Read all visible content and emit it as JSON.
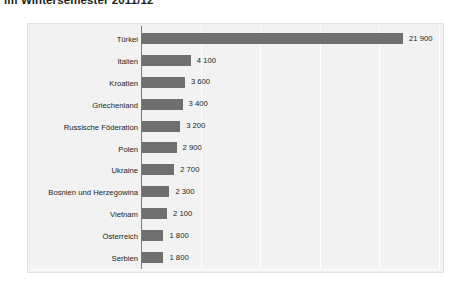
{
  "title": "im Wintersemester 2011/12",
  "chart_data": {
    "type": "bar",
    "orientation": "horizontal",
    "title": "im Wintersemester 2011/12",
    "xlabel": "",
    "ylabel": "",
    "xlim": [
      0,
      25000
    ],
    "grid": true,
    "gridlines_x": [
      5000,
      10000,
      15000,
      20000,
      25000
    ],
    "legend": null,
    "bar_color": "#6f6f6f",
    "panel_color": "#f2f2f2",
    "categories": [
      "Türkei",
      "Italien",
      "Kroatien",
      "Griechenland",
      "Russische Föderation",
      "Polen",
      "Ukraine",
      "Bosnien und Herzegowina",
      "Vietnam",
      "Österreich",
      "Serbien"
    ],
    "values": [
      21900,
      4100,
      3600,
      3400,
      3200,
      2900,
      2700,
      2300,
      2100,
      1800,
      1800
    ],
    "value_labels": [
      "21 900",
      "4 100",
      "3 600",
      "3 400",
      "3 200",
      "2 900",
      "2 700",
      "2 300",
      "2 100",
      "1 800",
      "1 800"
    ]
  }
}
